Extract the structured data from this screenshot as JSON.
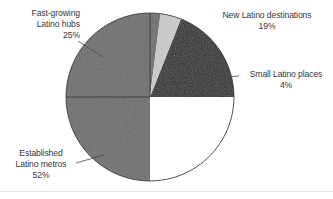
{
  "chart_data": {
    "type": "pie",
    "title": "",
    "subtitle": "",
    "xlabel": "",
    "ylabel": "",
    "legend_position": "callout-labels",
    "grid": false,
    "units": "percent",
    "start_angle_deg": 270,
    "direction": "clockwise",
    "categories": [
      "New Latino destinations",
      "Small Latino places",
      "Established Latino metros",
      "Fast-growing Latino hubs"
    ],
    "values": [
      19,
      4,
      52,
      25
    ],
    "value_labels": [
      "19%",
      "4%",
      "52%",
      "25%"
    ],
    "slices": [
      {
        "name": "new-latino-destinations",
        "label": "New Latino destinations",
        "value": 19,
        "value_label": "19%",
        "color": "#2b2b2d",
        "start_deg": 0,
        "end_deg": 68.4
      },
      {
        "name": "small-latino-places",
        "label": "Small Latino places",
        "value": 4,
        "value_label": "4%",
        "color": "#c9c9c9",
        "start_deg": 68.4,
        "end_deg": 82.8
      },
      {
        "name": "established-latino-metros",
        "label": "Established Latino metros",
        "value": 52,
        "value_label": "52%",
        "color": "#6f6f71",
        "start_deg": 82.8,
        "end_deg": 270.0
      },
      {
        "name": "fast-growing-latino-hubs",
        "label": "Fast-growing Latino hubs",
        "value": 25,
        "value_label": "25%",
        "color": "#ffffff",
        "start_deg": 270.0,
        "end_deg": 360.0
      }
    ]
  },
  "labels": {
    "fast_growing": {
      "line1": "Fast-growing",
      "line2": "Latino hubs",
      "line3": "25%"
    },
    "new_destinations": {
      "line1": "New Latino destinations",
      "line2": "19%"
    },
    "small_places": {
      "line1": "Small Latino places",
      "line2": "4%"
    },
    "established": {
      "line1": "Established",
      "line2": "Latino metros",
      "line3": "52%"
    }
  },
  "colors": {
    "slice_dark": "#2b2b2d",
    "slice_medium": "#6f6f71",
    "slice_light": "#c9c9c9",
    "slice_white": "#ffffff",
    "outline": "#3c3c3e",
    "text": "#36363a",
    "leader_line": "#4a4a4c",
    "footer_rule": "#e2e2e4",
    "background": "#ffffff"
  }
}
